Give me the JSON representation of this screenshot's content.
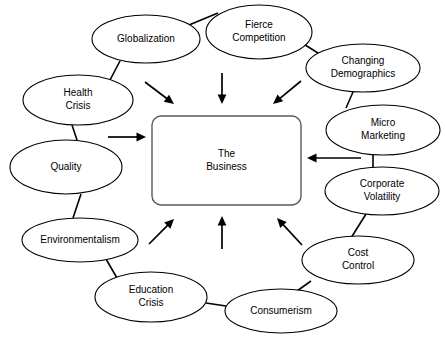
{
  "diagram": {
    "type": "hub-and-spoke-influence-diagram",
    "canvas": {
      "width": 445,
      "height": 350,
      "background": "#ffffff"
    },
    "center": {
      "label_line1": "The",
      "label_line2": "Business",
      "shape": "rounded-rectangle",
      "x": 152,
      "y": 116,
      "width": 149,
      "height": 89,
      "rx": 9,
      "stroke": "#58595b",
      "fill": "#ffffff"
    },
    "nodes": [
      {
        "id": "globalization",
        "label_line1": "Globalization",
        "label_line2": "",
        "cx": 146,
        "cy": 39,
        "rx": 54,
        "ry": 24,
        "stroke": "#000000",
        "fill": "#ffffff"
      },
      {
        "id": "fierce-competition",
        "label_line1": "Fierce",
        "label_line2": "Competition",
        "cx": 259,
        "cy": 32,
        "rx": 53,
        "ry": 27,
        "stroke": "#000000",
        "fill": "#ffffff"
      },
      {
        "id": "changing-demographics",
        "label_line1": "Changing",
        "label_line2": "Demographics",
        "cx": 363,
        "cy": 68,
        "rx": 57,
        "ry": 24,
        "stroke": "#000000",
        "fill": "#ffffff"
      },
      {
        "id": "micro-marketing",
        "label_line1": "Micro",
        "label_line2": "Marketing",
        "cx": 383,
        "cy": 130,
        "rx": 57,
        "ry": 25,
        "stroke": "#000000",
        "fill": "#ffffff"
      },
      {
        "id": "corporate-volatility",
        "label_line1": "Corporate",
        "label_line2": "Volatility",
        "cx": 382,
        "cy": 191,
        "rx": 57,
        "ry": 24,
        "stroke": "#000000",
        "fill": "#ffffff"
      },
      {
        "id": "cost-control",
        "label_line1": "Cost",
        "label_line2": "Control",
        "cx": 358,
        "cy": 260,
        "rx": 56,
        "ry": 24,
        "stroke": "#000000",
        "fill": "#ffffff"
      },
      {
        "id": "consumerism",
        "label_line1": "Consumerism",
        "label_line2": "",
        "cx": 281,
        "cy": 311,
        "rx": 56,
        "ry": 22,
        "stroke": "#000000",
        "fill": "#ffffff"
      },
      {
        "id": "education-crisis",
        "label_line1": "Education",
        "label_line2": "Crisis",
        "cx": 151,
        "cy": 297,
        "rx": 56,
        "ry": 25,
        "stroke": "#000000",
        "fill": "#ffffff"
      },
      {
        "id": "environmentalism",
        "label_line1": "Environmentalism",
        "label_line2": "",
        "cx": 80,
        "cy": 240,
        "rx": 58,
        "ry": 22,
        "stroke": "#000000",
        "fill": "#ffffff"
      },
      {
        "id": "quality",
        "label_line1": "Quality",
        "label_line2": "",
        "cx": 66,
        "cy": 167,
        "rx": 56,
        "ry": 27,
        "stroke": "#000000",
        "fill": "#ffffff"
      },
      {
        "id": "health-crisis",
        "label_line1": "Health",
        "label_line2": "Crisis",
        "cx": 78,
        "cy": 100,
        "rx": 55,
        "ry": 25,
        "stroke": "#000000",
        "fill": "#ffffff"
      }
    ],
    "connectors": [
      {
        "id": "globalization-to-fierce-competition",
        "from": "globalization",
        "to": "fierce-competition",
        "x1": 189,
        "y1": 25,
        "x2": 218,
        "y2": 13
      },
      {
        "id": "fierce-competition-to-changing-demographics",
        "from": "fierce-competition",
        "to": "changing-demographics",
        "x1": 302,
        "y1": 43,
        "x2": 318,
        "y2": 53
      },
      {
        "id": "changing-demographics-to-micro-marketing",
        "from": "changing-demographics",
        "to": "micro-marketing",
        "x1": 353,
        "y1": 92,
        "x2": 346,
        "y2": 108
      },
      {
        "id": "micro-marketing-to-corporate-volatility",
        "from": "micro-marketing",
        "to": "corporate-volatility",
        "x1": 373,
        "y1": 155,
        "x2": 373,
        "y2": 168
      },
      {
        "id": "corporate-volatility-to-cost-control",
        "from": "corporate-volatility",
        "to": "cost-control",
        "x1": 366,
        "y1": 214,
        "x2": 351,
        "y2": 238
      },
      {
        "id": "cost-control-to-consumerism",
        "from": "cost-control",
        "to": "consumerism",
        "x1": 311,
        "y1": 281,
        "x2": 297,
        "y2": 291
      },
      {
        "id": "consumerism-to-education-crisis",
        "from": "consumerism",
        "to": "education-crisis",
        "x1": 226,
        "y1": 306,
        "x2": 206,
        "y2": 303
      },
      {
        "id": "education-crisis-to-environmentalism",
        "from": "education-crisis",
        "to": "environmentalism",
        "x1": 117,
        "y1": 278,
        "x2": 106,
        "y2": 259
      },
      {
        "id": "environmentalism-to-quality",
        "from": "environmentalism",
        "to": "quality",
        "x1": 73,
        "y1": 218,
        "x2": 81,
        "y2": 194
      },
      {
        "id": "quality-to-health-crisis",
        "from": "quality",
        "to": "health-crisis",
        "x1": 77,
        "y1": 140,
        "x2": 72,
        "y2": 125
      },
      {
        "id": "health-crisis-to-globalization",
        "from": "health-crisis",
        "to": "globalization",
        "x1": 110,
        "y1": 80,
        "x2": 120,
        "y2": 61
      }
    ],
    "flow_arrows": [
      {
        "id": "arrow-top-left-inward",
        "direction": "down-right",
        "x1": 145,
        "y1": 82,
        "x2": 174,
        "y2": 104
      },
      {
        "id": "arrow-top-center-inward",
        "direction": "down",
        "x1": 222,
        "y1": 73,
        "x2": 222,
        "y2": 104
      },
      {
        "id": "arrow-top-right-inward",
        "direction": "down-left",
        "x1": 301,
        "y1": 81,
        "x2": 273,
        "y2": 104
      },
      {
        "id": "arrow-left-inward",
        "direction": "right",
        "x1": 108,
        "y1": 137,
        "x2": 146,
        "y2": 137
      },
      {
        "id": "arrow-right-inward",
        "direction": "left",
        "x1": 361,
        "y1": 158,
        "x2": 307,
        "y2": 158
      },
      {
        "id": "arrow-bottom-left-inward",
        "direction": "up-right",
        "x1": 149,
        "y1": 244,
        "x2": 174,
        "y2": 219
      },
      {
        "id": "arrow-bottom-center-inward",
        "direction": "up",
        "x1": 222,
        "y1": 249,
        "x2": 222,
        "y2": 216
      },
      {
        "id": "arrow-bottom-right-inward",
        "direction": "up-left",
        "x1": 302,
        "y1": 245,
        "x2": 277,
        "y2": 218
      }
    ]
  }
}
